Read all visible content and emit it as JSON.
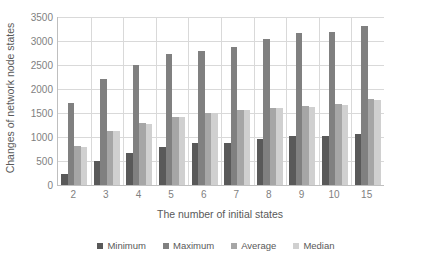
{
  "chart_data": {
    "type": "bar",
    "title": "",
    "xlabel": "The number of initial states",
    "ylabel": "Changes of network node states",
    "categories": [
      "2",
      "3",
      "4",
      "5",
      "6",
      "7",
      "8",
      "9",
      "10",
      "15"
    ],
    "ylim": [
      0,
      3500
    ],
    "yticks": [
      0,
      500,
      1000,
      1500,
      2000,
      2500,
      3000,
      3500
    ],
    "ytick_labels": [
      "0",
      "500",
      "1000",
      "1500",
      "2000",
      "2500",
      "3000",
      "3500"
    ],
    "grid": true,
    "grid_axis": "both",
    "legend_position": "bottom",
    "series": [
      {
        "name": "Minimum",
        "color": "#595959",
        "values": [
          230,
          500,
          670,
          800,
          865,
          880,
          960,
          1015,
          1030,
          1065
        ]
      },
      {
        "name": "Maximum",
        "color": "#808080",
        "values": [
          1710,
          2210,
          2510,
          2730,
          2800,
          2870,
          3040,
          3160,
          3180,
          3310
        ]
      },
      {
        "name": "Average",
        "color": "#a6a6a6",
        "values": [
          820,
          1120,
          1300,
          1420,
          1500,
          1560,
          1600,
          1640,
          1680,
          1790
        ]
      },
      {
        "name": "Median",
        "color": "#d0d0d0",
        "values": [
          790,
          1115,
          1280,
          1410,
          1495,
          1555,
          1600,
          1630,
          1670,
          1780
        ]
      }
    ]
  },
  "axis": {
    "y_title": "Changes of network node states",
    "x_title": "The number of initial states"
  },
  "legend": {
    "items": [
      {
        "label": "Minimum",
        "color": "#595959"
      },
      {
        "label": "Maximum",
        "color": "#808080"
      },
      {
        "label": "Average",
        "color": "#a6a6a6"
      },
      {
        "label": "Median",
        "color": "#d0d0d0"
      }
    ]
  },
  "colors": {
    "axis_line": "#bfbfbf",
    "gridline": "#d9d9d9",
    "tick_text": "#7f7f7f",
    "title_text": "#595959",
    "background": "#ffffff"
  }
}
